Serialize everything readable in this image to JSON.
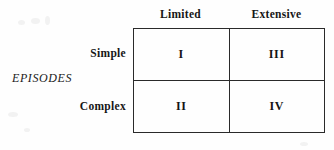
{
  "figure": {
    "axis_label": "EPISODES",
    "column_headers": [
      "Limited",
      "Extensive"
    ],
    "row_labels": [
      "Simple",
      "Complex"
    ],
    "cells": [
      [
        "I",
        "III"
      ],
      [
        "II",
        "IV"
      ]
    ],
    "colors": {
      "background": "#fefefe",
      "border": "#2a2a2a",
      "text": "#1a1a1a"
    }
  }
}
